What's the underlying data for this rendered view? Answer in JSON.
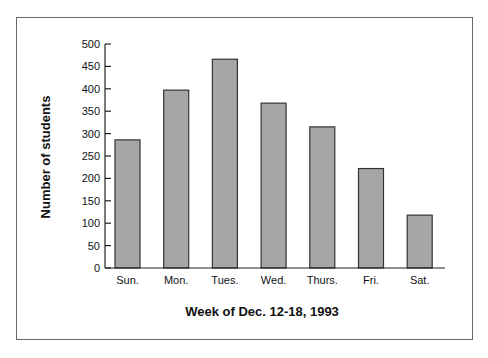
{
  "chart_data": {
    "type": "bar",
    "title": "",
    "xlabel": "Week of Dec. 12-18, 1993",
    "ylabel": "Number of students",
    "categories": [
      "Sun.",
      "Mon.",
      "Tues.",
      "Wed.",
      "Thurs.",
      "Fri.",
      "Sat."
    ],
    "values": [
      286,
      397,
      466,
      368,
      315,
      222,
      118
    ],
    "ylim": [
      0,
      500
    ],
    "yticks": [
      0,
      50,
      100,
      150,
      200,
      250,
      300,
      350,
      400,
      450,
      500
    ],
    "grid": false,
    "legend": null,
    "bar_color": "#a6a6a6",
    "bar_edge_color": "#333333"
  }
}
